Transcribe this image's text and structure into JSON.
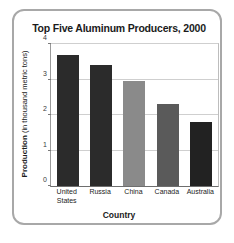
{
  "figure": {
    "border_color": "#a8a8a8",
    "background": "#ffffff"
  },
  "chart_data": {
    "type": "bar",
    "title": "Top Five Aluminum Producers, 2000",
    "xlabel": "Country",
    "ylabel": "Production (in thousand metric tons)",
    "ylabel_bold_part": "Production",
    "ylabel_rest": " (in thousand metric tons)",
    "categories": [
      "United States",
      "Russia",
      "China",
      "Canada",
      "Australia"
    ],
    "category_lines": [
      [
        "United",
        "States"
      ],
      [
        "Russia"
      ],
      [
        "China"
      ],
      [
        "Canada"
      ],
      [
        "Australia"
      ]
    ],
    "values": [
      3.7,
      3.4,
      2.95,
      2.3,
      1.8
    ],
    "bar_colors": [
      "#2b2b2b",
      "#2b2b2b",
      "#8a8a8a",
      "#5a5a5a",
      "#222222"
    ],
    "ylim": [
      0,
      4
    ],
    "yticks": [
      0,
      1,
      2,
      3,
      4
    ],
    "ytick_labels": [
      "0",
      "1",
      "2",
      "3",
      "4"
    ],
    "grid": true,
    "grid_color": "#cfcfcf",
    "legend": null
  }
}
